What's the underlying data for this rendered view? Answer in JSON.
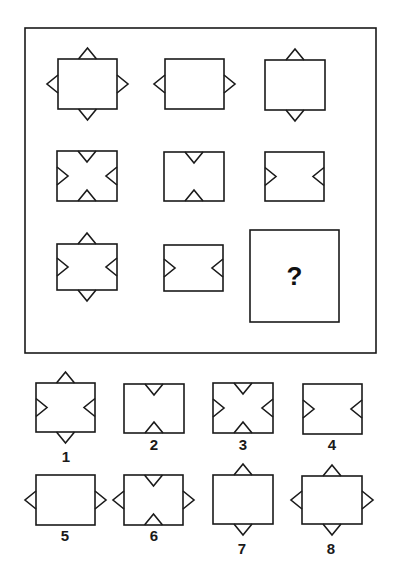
{
  "puzzle": {
    "type": "matrix-reasoning",
    "stroke_color": "#1a1a1a",
    "background": "#ffffff",
    "frame": {
      "x": 25,
      "y": 28,
      "w": 351,
      "h": 325
    },
    "missing_cell": {
      "x": 250,
      "y": 230,
      "w": 89,
      "h": 92,
      "symbol": "?"
    },
    "triangle": {
      "base": 18,
      "depth": 11
    },
    "matrix": [
      {
        "id": "r1c1",
        "rect": [
          58,
          59,
          59,
          50
        ],
        "outward": [
          "top",
          "bottom",
          "left",
          "right"
        ],
        "inward": []
      },
      {
        "id": "r1c2",
        "rect": [
          165,
          59,
          59,
          50
        ],
        "outward": [
          "left",
          "right"
        ],
        "inward": []
      },
      {
        "id": "r1c3",
        "rect": [
          265,
          60,
          60,
          50
        ],
        "outward": [
          "top",
          "bottom"
        ],
        "inward": []
      },
      {
        "id": "r2c1",
        "rect": [
          57,
          151,
          60,
          50
        ],
        "outward": [],
        "inward": [
          "top",
          "bottom",
          "left",
          "right"
        ]
      },
      {
        "id": "r2c2",
        "rect": [
          164,
          152,
          60,
          49
        ],
        "outward": [],
        "inward": [
          "top",
          "bottom"
        ]
      },
      {
        "id": "r2c3",
        "rect": [
          265,
          152,
          59,
          49
        ],
        "outward": [],
        "inward": [
          "left",
          "right"
        ]
      },
      {
        "id": "r3c1",
        "rect": [
          57,
          244,
          60,
          46
        ],
        "outward": [
          "top",
          "bottom"
        ],
        "inward": [
          "left",
          "right"
        ]
      },
      {
        "id": "r3c2",
        "rect": [
          164,
          245,
          59,
          46
        ],
        "outward": [],
        "inward": [
          "left",
          "right"
        ]
      }
    ],
    "options": [
      {
        "label": "1",
        "rect": [
          36,
          383,
          59,
          49
        ],
        "outward": [
          "top",
          "bottom"
        ],
        "inward": [
          "left",
          "right"
        ],
        "label_pos": [
          66,
          462
        ]
      },
      {
        "label": "2",
        "rect": [
          124,
          384,
          60,
          49
        ],
        "outward": [],
        "inward": [
          "top",
          "bottom"
        ],
        "label_pos": [
          154,
          450
        ]
      },
      {
        "label": "3",
        "rect": [
          213,
          383,
          60,
          50
        ],
        "outward": [],
        "inward": [
          "top",
          "bottom",
          "left",
          "right"
        ],
        "label_pos": [
          243,
          450
        ]
      },
      {
        "label": "4",
        "rect": [
          303,
          384,
          59,
          50
        ],
        "outward": [],
        "inward": [
          "left",
          "right"
        ],
        "label_pos": [
          332,
          450
        ]
      },
      {
        "label": "5",
        "rect": [
          36,
          475,
          59,
          50
        ],
        "outward": [
          "left",
          "right"
        ],
        "inward": [],
        "label_pos": [
          65,
          541
        ]
      },
      {
        "label": "6",
        "rect": [
          124,
          475,
          59,
          50
        ],
        "outward": [
          "left",
          "right"
        ],
        "inward": [
          "top",
          "bottom"
        ],
        "label_pos": [
          154,
          541
        ]
      },
      {
        "label": "7",
        "rect": [
          213,
          475,
          60,
          49
        ],
        "outward": [
          "top",
          "bottom"
        ],
        "inward": [],
        "label_pos": [
          242,
          554
        ]
      },
      {
        "label": "8",
        "rect": [
          302,
          476,
          60,
          48
        ],
        "outward": [
          "top",
          "bottom",
          "left",
          "right"
        ],
        "inward": [],
        "label_pos": [
          331,
          554
        ]
      }
    ]
  }
}
